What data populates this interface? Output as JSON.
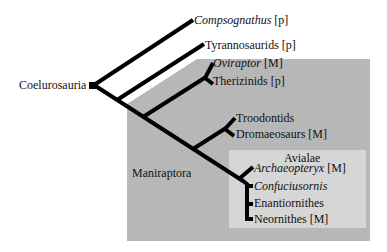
{
  "diagram": {
    "type": "cladogram",
    "root": {
      "label": "Coelurosauria"
    },
    "clades": [
      {
        "label": "Maniraptora",
        "shade": "#b7b7b7"
      },
      {
        "label": "Avialae",
        "shade": "#d6d6d6"
      }
    ],
    "taxa": [
      {
        "name": "Compsognathus",
        "italic": true,
        "tag": "[p]"
      },
      {
        "name": "Tyrannosaurids",
        "italic": false,
        "tag": "[p]"
      },
      {
        "name": "Oviraptor",
        "italic": true,
        "tag": "[M]"
      },
      {
        "name": "Therizinids",
        "italic": false,
        "tag": "[p]"
      },
      {
        "name": "Troodontids",
        "italic": false,
        "tag": ""
      },
      {
        "name": "Dromaeosaurs",
        "italic": false,
        "tag": "[M]"
      },
      {
        "name": "Archaeopteryx",
        "italic": true,
        "tag": "[M]"
      },
      {
        "name": "Confuciusornis",
        "italic": true,
        "tag": ""
      },
      {
        "name": "Enantiornithes",
        "italic": false,
        "tag": ""
      },
      {
        "name": "Neornithes",
        "italic": false,
        "tag": "[M]"
      }
    ],
    "colors": {
      "line": "#000000",
      "outer_region": "#b7b7b7",
      "inner_region": "#d6d6d6"
    }
  }
}
